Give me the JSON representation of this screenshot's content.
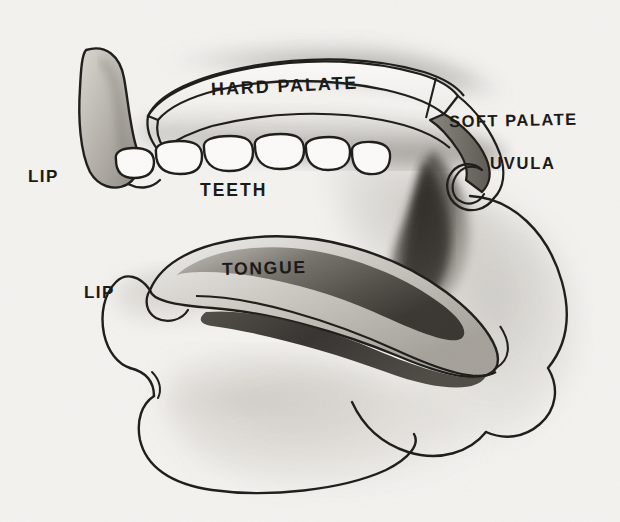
{
  "figure": {
    "medium": "pencil and charcoal drawing on paper",
    "background_color": "#f3f2ef",
    "ink_color": "#1b1a18"
  },
  "labels": {
    "hard_palate": "HARD PALATE",
    "soft_palate": "SOFT PALATE",
    "uvula": "UVULA",
    "lip_upper": "LIP",
    "lip_lower": "LIP",
    "teeth": "TEETH",
    "tongue": "TONGUE"
  },
  "structures": [
    {
      "name": "upper-lip",
      "label": "LIP"
    },
    {
      "name": "lower-lip",
      "label": "LIP"
    },
    {
      "name": "hard-palate",
      "label": "HARD PALATE"
    },
    {
      "name": "soft-palate",
      "label": "SOFT PALATE"
    },
    {
      "name": "uvula",
      "label": "UVULA"
    },
    {
      "name": "teeth",
      "label": "TEETH",
      "count": 6
    },
    {
      "name": "tongue",
      "label": "TONGUE"
    },
    {
      "name": "pharynx",
      "label": ""
    },
    {
      "name": "lower-jaw",
      "label": ""
    }
  ]
}
